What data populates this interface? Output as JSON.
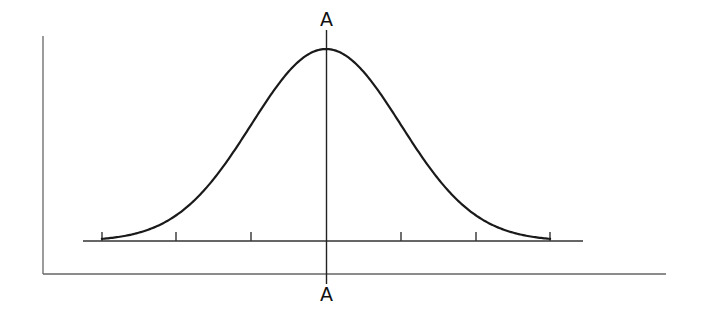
{
  "diagram": {
    "type": "normal-distribution-curve",
    "labels": {
      "top_axis_label": "A",
      "bottom_axis_label": "A"
    },
    "colors": {
      "curve": "#1a1a1a",
      "axes": "#555555",
      "baseline": "#333333",
      "center_line": "#222222"
    },
    "geometry": {
      "center_x": 326,
      "baseline_y": 241,
      "peak_y": 49,
      "sigma_px": 74.7,
      "tick_positions_x": [
        102,
        176,
        251,
        401,
        476,
        550
      ],
      "baseline_x_range": [
        83,
        583
      ],
      "outer_axis": {
        "left_x": 43,
        "top_y": 36,
        "bottom_y": 274,
        "right_x": 666
      }
    },
    "tick_count": 6
  }
}
